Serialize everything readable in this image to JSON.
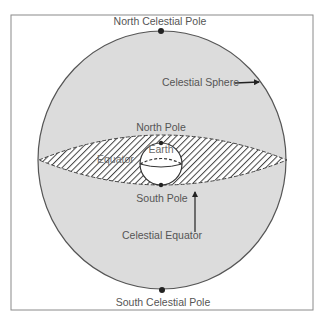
{
  "diagram": {
    "title": "Celestial Sphere",
    "labels": {
      "north_celestial_pole": "North Celestial Pole",
      "south_celestial_pole": "South Celestial Pole",
      "celestial_sphere": "Celestial Sphere",
      "north_pole": "North Pole",
      "south_pole": "South Pole",
      "earth": "Earth",
      "equator": "Equator",
      "celestial_equator": "Celestial Equator"
    },
    "colors": {
      "frame": "#8a8a8a",
      "sphere_fill": "#dcdcdc",
      "sphere_outline": "#555555",
      "hatch": "#444444",
      "earth_fill": "#ffffff",
      "pole_dot": "#222222",
      "text": "#555555"
    }
  }
}
